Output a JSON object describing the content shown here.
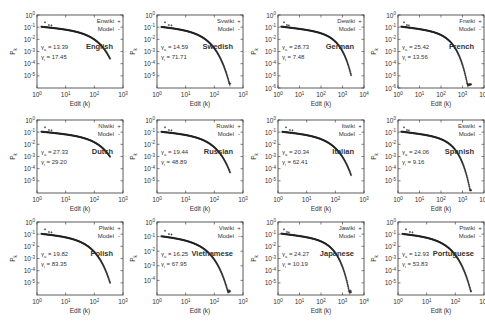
{
  "chart_data": [
    {
      "type": "scatter",
      "title": "English",
      "legend": [
        "Enwiki",
        "Model"
      ],
      "xlabel": "Edit (k)",
      "ylabel": "P_k",
      "xscale": "log",
      "yscale": "log",
      "xlim": [
        1,
        1000
      ],
      "ylim": [
        1e-06,
        1
      ],
      "xticks": [
        "10^0",
        "10^1",
        "10^2",
        "10^3"
      ],
      "yticks": [
        "10^0",
        "10^-1",
        "10^-2",
        "10^-3",
        "10^-4",
        "10^-5"
      ],
      "gamma_a": 13.39,
      "gamma_i": 17.45
    },
    {
      "type": "scatter",
      "title": "Swedish",
      "legend": [
        "Svwiki",
        "Model"
      ],
      "xlabel": "Edit (k)",
      "ylabel": "P_k",
      "xscale": "log",
      "yscale": "log",
      "xlim": [
        1,
        1000
      ],
      "ylim": [
        1e-06,
        1
      ],
      "xticks": [
        "10^0",
        "10^1",
        "10^2",
        "10^3"
      ],
      "yticks": [
        "10^0",
        "10^-1",
        "10^-2",
        "10^-3",
        "10^-4",
        "10^-5"
      ],
      "gamma_a": 14.59,
      "gamma_i": 71.71
    },
    {
      "type": "scatter",
      "title": "German",
      "legend": [
        "Dewiki",
        "Model"
      ],
      "xlabel": "Edit (k)",
      "ylabel": "P_k",
      "xscale": "log",
      "yscale": "log",
      "xlim": [
        1,
        10000
      ],
      "ylim": [
        1e-06,
        1
      ],
      "xticks": [
        "10^0",
        "10^1",
        "10^2",
        "10^3",
        "10^4"
      ],
      "yticks": [
        "10^0",
        "10^-1",
        "10^-2",
        "10^-3",
        "10^-4",
        "10^-5",
        "10^-6"
      ],
      "gamma_a": 28.73,
      "gamma_i": 7.48
    },
    {
      "type": "scatter",
      "title": "French",
      "legend": [
        "Frwiki",
        "Model"
      ],
      "xlabel": "Edit (k)",
      "ylabel": "P_k",
      "xscale": "log",
      "yscale": "log",
      "xlim": [
        1,
        10000
      ],
      "ylim": [
        1e-06,
        1
      ],
      "xticks": [
        "10^0",
        "10^1",
        "10^2",
        "10^3",
        "10^4"
      ],
      "yticks": [
        "10^0",
        "10^-1",
        "10^-2",
        "10^-3",
        "10^-4",
        "10^-5",
        "10^-6"
      ],
      "gamma_a": 25.42,
      "gamma_i": 13.56
    },
    {
      "type": "scatter",
      "title": "Dutch",
      "legend": [
        "Nlwiki",
        "Model"
      ],
      "xlabel": "Edit (k)",
      "ylabel": "P_k",
      "xscale": "log",
      "yscale": "log",
      "xlim": [
        1,
        1000
      ],
      "ylim": [
        1e-06,
        1
      ],
      "xticks": [
        "10^0",
        "10^1",
        "10^2",
        "10^3"
      ],
      "yticks": [
        "10^0",
        "10^-1",
        "10^-2",
        "10^-3",
        "10^-4",
        "10^-5"
      ],
      "gamma_a": 27.33,
      "gamma_i": 29.2
    },
    {
      "type": "scatter",
      "title": "Russian",
      "legend": [
        "Ruwiki",
        "Model"
      ],
      "xlabel": "Edit (k)",
      "ylabel": "P_k",
      "xscale": "log",
      "yscale": "log",
      "xlim": [
        1,
        1000
      ],
      "ylim": [
        1e-06,
        1
      ],
      "xticks": [
        "10^0",
        "10^1",
        "10^2",
        "10^3"
      ],
      "yticks": [
        "10^0",
        "10^-1",
        "10^-2",
        "10^-3",
        "10^-4",
        "10^-5"
      ],
      "gamma_a": 19.44,
      "gamma_i": 48.89
    },
    {
      "type": "scatter",
      "title": "Italian",
      "legend": [
        "Itwiki",
        "Model"
      ],
      "xlabel": "Edit (k)",
      "ylabel": "P_k",
      "xscale": "log",
      "yscale": "log",
      "xlim": [
        1,
        1000
      ],
      "ylim": [
        1e-06,
        1
      ],
      "xticks": [
        "10^0",
        "10^1",
        "10^2",
        "10^3"
      ],
      "yticks": [
        "10^0",
        "10^-1",
        "10^-2",
        "10^-3",
        "10^-4",
        "10^-5"
      ],
      "gamma_a": 20.34,
      "gamma_i": 62.41
    },
    {
      "type": "scatter",
      "title": "Spanish",
      "legend": [
        "Eswiki",
        "Model"
      ],
      "xlabel": "Edit (k)",
      "ylabel": "P_k",
      "xscale": "log",
      "yscale": "log",
      "xlim": [
        1,
        10000
      ],
      "ylim": [
        1e-06,
        1
      ],
      "xticks": [
        "10^0",
        "10^1",
        "10^2",
        "10^3",
        "10^4"
      ],
      "yticks": [
        "10^0",
        "10^-1",
        "10^-2",
        "10^-3",
        "10^-4",
        "10^-5"
      ],
      "gamma_a": 24.06,
      "gamma_i": 9.16
    },
    {
      "type": "scatter",
      "title": "Polish",
      "legend": [
        "Plwiki",
        "Model"
      ],
      "xlabel": "Edit (k)",
      "ylabel": "P_k",
      "xscale": "log",
      "yscale": "log",
      "xlim": [
        1,
        1000
      ],
      "ylim": [
        1e-06,
        1
      ],
      "xticks": [
        "10^0",
        "10^1",
        "10^2",
        "10^3"
      ],
      "yticks": [
        "10^0",
        "10^-1",
        "10^-2",
        "10^-3",
        "10^-4",
        "10^-5"
      ],
      "gamma_a": 19.82,
      "gamma_i": 83.35
    },
    {
      "type": "scatter",
      "title": "Vietnamese",
      "legend": [
        "Viwiki",
        "Model"
      ],
      "xlabel": "Edit (k)",
      "ylabel": "P_k",
      "xscale": "log",
      "yscale": "log",
      "xlim": [
        1,
        1000
      ],
      "ylim": [
        1e-05,
        1
      ],
      "xticks": [
        "10^0",
        "10^1",
        "10^2",
        "10^3"
      ],
      "yticks": [
        "10^0",
        "10^-1",
        "10^-2",
        "10^-3",
        "10^-4"
      ],
      "gamma_a": 16.25,
      "gamma_i": 67.95
    },
    {
      "type": "scatter",
      "title": "Japanese",
      "legend": [
        "Jawiki",
        "Model"
      ],
      "xlabel": "Edit (k)",
      "ylabel": "P_k",
      "xscale": "log",
      "yscale": "log",
      "xlim": [
        1,
        10000
      ],
      "ylim": [
        1e-06,
        1
      ],
      "xticks": [
        "10^0",
        "10^1",
        "10^2",
        "10^3",
        "10^4"
      ],
      "yticks": [
        "10^0",
        "10^-1",
        "10^-2",
        "10^-3",
        "10^-4",
        "10^-5"
      ],
      "gamma_a": 24.27,
      "gamma_i": 10.19
    },
    {
      "type": "scatter",
      "title": "Portuguese",
      "legend": [
        "Ptwiki",
        "Model"
      ],
      "xlabel": "Edit (k)",
      "ylabel": "P_k",
      "xscale": "log",
      "yscale": "log",
      "xlim": [
        1,
        1000
      ],
      "ylim": [
        1e-06,
        1
      ],
      "xticks": [
        "10^0",
        "10^1",
        "10^2",
        "10^3"
      ],
      "yticks": [
        "10^0",
        "10^-1",
        "10^-2",
        "10^-3",
        "10^-4",
        "10^-5"
      ],
      "gamma_a": 12.93,
      "gamma_i": 53.83
    }
  ],
  "layout": {
    "panels": [
      {
        "x": 0,
        "y": 0
      },
      {
        "x": 120,
        "y": 0
      },
      {
        "x": 241,
        "y": 0
      },
      {
        "x": 361,
        "y": 0
      },
      {
        "x": 0,
        "y": 105
      },
      {
        "x": 120,
        "y": 105
      },
      {
        "x": 241,
        "y": 105
      },
      {
        "x": 361,
        "y": 105
      },
      {
        "x": 0,
        "y": 207
      },
      {
        "x": 120,
        "y": 207
      },
      {
        "x": 241,
        "y": 207
      },
      {
        "x": 361,
        "y": 207
      }
    ]
  },
  "labels": {
    "gamma_a_prefix": "γa = ",
    "gamma_i_prefix": "γi = ",
    "model_marker": "-",
    "data_marker": "+"
  },
  "colors": {
    "frame": "#333333",
    "points": "#222222",
    "model": "#888888",
    "text": "#333333"
  }
}
